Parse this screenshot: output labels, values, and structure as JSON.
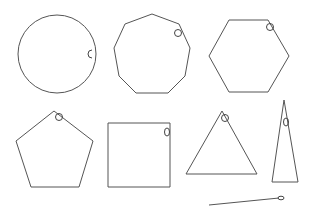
{
  "diagram": {
    "stroke_color": "#555555",
    "background": "#ffffff",
    "shapes": [
      {
        "name": "circle",
        "sides": 0,
        "center": [
          57,
          54
        ],
        "radius": 39,
        "marker": [
          92,
          54
        ]
      },
      {
        "name": "nonagon",
        "sides": 9,
        "points": "152,14 179,24 190,48 185,76 168,93 136,93 119,76 114,48 125,24",
        "marker": [
          178,
          33
        ]
      },
      {
        "name": "hexagon",
        "sides": 6,
        "points": "229,20 268,20 289,56 268,92 229,92 209,56",
        "marker": [
          270,
          27
        ]
      },
      {
        "name": "pentagon",
        "sides": 5,
        "points": "54,111 93,141 79,187 31,187 16,141",
        "marker": [
          59,
          117
        ]
      },
      {
        "name": "square",
        "sides": 4,
        "points": "108,123 170,123 170,187 108,187",
        "marker": [
          167,
          132
        ]
      },
      {
        "name": "triangle",
        "sides": 3,
        "points": "222,111 257,174 186,174",
        "marker": [
          225,
          118
        ]
      },
      {
        "name": "thin-triangle",
        "sides": 3,
        "points": "284,100 298,182 272,182",
        "marker": [
          286,
          122
        ]
      },
      {
        "name": "line",
        "sides": 2,
        "points": "209,205 279,198",
        "marker": [
          281,
          198
        ]
      }
    ]
  }
}
